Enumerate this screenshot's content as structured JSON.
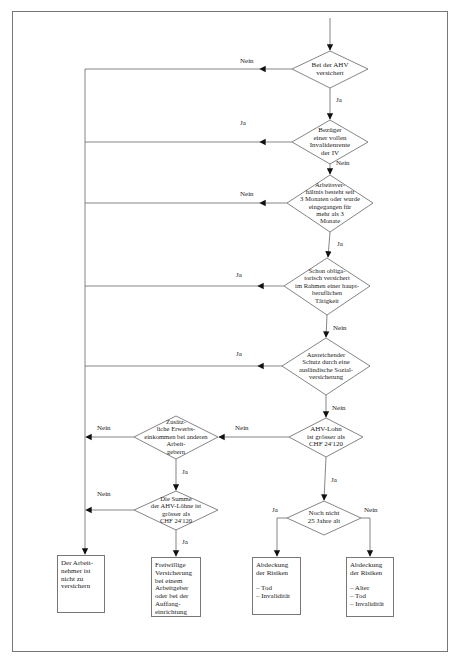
{
  "diagram": {
    "decisions": [
      {
        "id": "d1",
        "text": "Bei der AHV\nversichert",
        "no_label": "Nein",
        "yes_label": "Ja"
      },
      {
        "id": "d2",
        "text": "Bezüger\neiner vollen\nInvalidenrente\nder IV",
        "yes_label": "Ja",
        "no_label": "Nein"
      },
      {
        "id": "d3",
        "text": "Arbeitsver-\nhältnis besteht seit\n3 Monaten oder wurde\neingegangen für\nmehr als 3\nMonate",
        "no_label": "Nein",
        "yes_label": "Ja"
      },
      {
        "id": "d4",
        "text": "Schon obliga-\ntorisch versichert\nim Rahmen einer haupt-\nberuflichen\nTätigkeit",
        "yes_label": "Ja",
        "no_label": "Nein"
      },
      {
        "id": "d5",
        "text": "Ausreichender\nSchutz durch eine\nausländische Sozial-\nversicherung",
        "yes_label": "Ja",
        "no_label": "Nein"
      },
      {
        "id": "d6",
        "text": "AHV-Lohn\nist grösser als\nCHF 24'120",
        "no_label": "Nein",
        "yes_label": "Ja"
      },
      {
        "id": "d7",
        "text": "Zusätz-\nliche Erwerbs-\neinkommen bei anderen\nArbeit-\ngebern",
        "no_label": "Nein",
        "yes_label": "Ja"
      },
      {
        "id": "d8",
        "text": "Die Summe\nder AHV-Löhne ist\ngrösser als\nCHF 24'120",
        "no_label": "Nein",
        "yes_label": "Ja"
      },
      {
        "id": "d9",
        "text": "Noch nicht\n25 Jahre alt",
        "yes_label": "Ja",
        "no_label": "Nein"
      }
    ],
    "outcomes": [
      {
        "id": "o1",
        "text": "Der Arbeit-\nnehmer ist\nnicht zu\nversichern"
      },
      {
        "id": "o2",
        "text": "Freiwillige\nVersicherung\nbei einem\nArbeitgeber\noder bei der\nAuffang-\neinrichtung"
      },
      {
        "id": "o3",
        "text": "Abdeckung\nder Risiken\n\n– Tod\n– Invalidität"
      },
      {
        "id": "o4",
        "text": "Abdeckung\nder Risiken\n\n– Alter\n– Tod\n– Invalidität"
      }
    ],
    "colors": {
      "line": "#777777",
      "arrow": "#111111",
      "text": "#222222"
    }
  }
}
